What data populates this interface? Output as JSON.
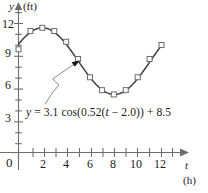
{
  "chart_data": {
    "type": "line",
    "title": "",
    "xlabel": "t",
    "xunit": "(h)",
    "ylabel": "y",
    "yunit": "(ft)",
    "xlim": [
      -0.6,
      13.2
    ],
    "ylim": [
      0,
      13.2
    ],
    "grid": false,
    "legend": null,
    "annotation": "y = 3.1 cos(0.52(t − 2.0)) + 8.5",
    "equation": {
      "lhs": "y",
      "eq": "=",
      "amplitude": "3.1",
      "func": "cos",
      "frequency": "0.52",
      "variable": "t",
      "phase": "2.0",
      "offset": "8.5"
    },
    "x_ticks_major": [
      0,
      2,
      4,
      6,
      8,
      10,
      12
    ],
    "x_tick_labels": [
      "0",
      "2",
      "4",
      "6",
      "8",
      "10",
      "12"
    ],
    "x_ticks_minor": [
      1,
      3,
      5,
      7,
      9,
      11,
      13
    ],
    "y_ticks_major": [
      3,
      6,
      9,
      12
    ],
    "y_tick_labels": [
      "3",
      "6",
      "9",
      "12"
    ],
    "y_ticks_minor": [
      1,
      2,
      4,
      5,
      7,
      8,
      10,
      11,
      13
    ],
    "x": [
      0,
      1,
      2,
      3,
      4,
      5,
      6,
      7,
      8,
      9,
      10,
      11,
      12
    ],
    "values": [
      9.6,
      11.3,
      11.6,
      11.3,
      10.3,
      8.7,
      7.0,
      5.8,
      5.4,
      5.8,
      7.0,
      8.7,
      10.0
    ],
    "series": [
      {
        "name": "tide height",
        "marker": "open-square",
        "values": [
          9.6,
          11.3,
          11.6,
          11.3,
          10.3,
          8.7,
          7.0,
          5.8,
          5.4,
          5.8,
          7.0,
          8.7,
          10.0
        ]
      }
    ],
    "curve_model": {
      "amplitude": 3.1,
      "omega": 0.52,
      "phase_shift": 2.0,
      "vertical_shift": 8.5
    },
    "colors": {
      "curve": "#3f3f3f",
      "marker_stroke": "#6b6b6b",
      "marker_fill": "#ffffff",
      "axis": "#6e6e6e",
      "text": "#1a1a1a",
      "leader": "#7a7a7a",
      "background": "#ffffff"
    },
    "leader_line": {
      "from_text": "equation-label",
      "points": "45,104 52,92 58,84 52,78 62,72 78,62",
      "arrow_at": [
        78,
        62
      ]
    }
  }
}
